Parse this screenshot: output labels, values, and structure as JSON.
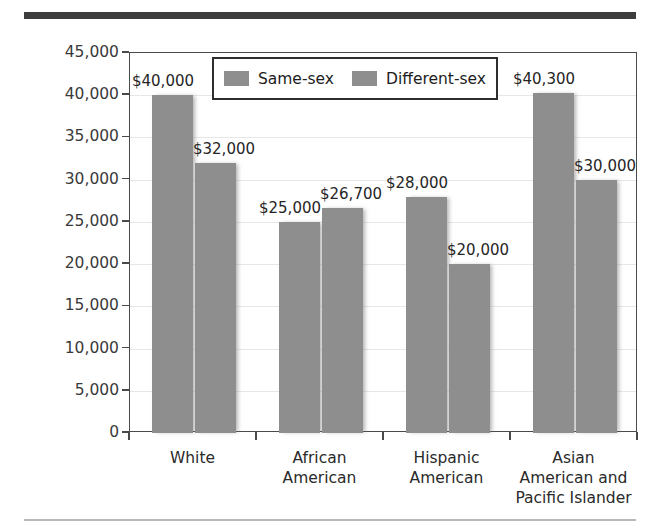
{
  "decor": {
    "top_rule_color": "#3d3d3d",
    "bottom_rule_color": "#b9b9b9"
  },
  "chart_data": {
    "type": "bar",
    "title": "",
    "xlabel": "",
    "ylabel": "Median Income in Dollars",
    "ylim": [
      0,
      45000
    ],
    "ytick_step": 5000,
    "ytick_labels": [
      "45,000",
      "40,000",
      "35,000",
      "30,000",
      "25,000",
      "20,000",
      "15,000",
      "10,000",
      "5,000",
      "0"
    ],
    "ytick_values": [
      45000,
      40000,
      35000,
      30000,
      25000,
      20000,
      15000,
      10000,
      5000,
      0
    ],
    "grid": true,
    "legend_position": "top-center",
    "categories": [
      "White",
      "African American",
      "Hispanic American",
      "Asian American and Pacific Islander"
    ],
    "category_lines": [
      [
        "White"
      ],
      [
        "African",
        "American"
      ],
      [
        "Hispanic",
        "American"
      ],
      [
        "Asian",
        "American and",
        "Pacific Islander"
      ]
    ],
    "series": [
      {
        "name": "Same-sex",
        "color": "#8e8e8e",
        "values": [
          40000,
          25000,
          28000,
          40300
        ],
        "labels": [
          "$40,000",
          "$25,000",
          "$28,000",
          "$40,300"
        ]
      },
      {
        "name": "Different-sex",
        "color": "#8e8e8e",
        "values": [
          32000,
          26700,
          20000,
          30000
        ],
        "labels": [
          "$32,000",
          "$26,700",
          "$20,000",
          "$30,000"
        ]
      }
    ]
  }
}
